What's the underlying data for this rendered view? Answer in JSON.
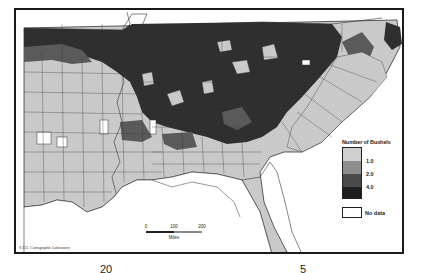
{
  "map": {
    "subject": "Bushels per county, southeastern United States",
    "region": "Southeastern United States (Louisiana to Virginia/North Carolina coast)",
    "colors": {
      "class_1": "#c8c8c8",
      "class_2": "#8e8e8e",
      "class_3": "#4a4a4a",
      "class_4": "#1e1e1e",
      "no_data": "#ffffff",
      "water": "#ffffff",
      "outline": "#333333"
    }
  },
  "legend": {
    "title": "Number of Bushels",
    "breaks": [
      "1.0",
      "2.0",
      "4.0"
    ],
    "classes": [
      {
        "label": "< 1.0",
        "color": "#c8c8c8"
      },
      {
        "label": "1.0 – 2.0",
        "color": "#8e8e8e"
      },
      {
        "label": "2.0 – 4.0",
        "color": "#4a4a4a"
      },
      {
        "label": "> 4.0",
        "color": "#1e1e1e"
      }
    ],
    "no_data_label": "No data"
  },
  "scale_bar": {
    "ticks": [
      "0",
      "100",
      "200"
    ],
    "units": "Miles"
  },
  "credit": "S.T.U. Cartographic Laboratory",
  "page_fragments": [
    {
      "text": "20",
      "x": 105
    },
    {
      "text": "5",
      "x": 300
    }
  ]
}
